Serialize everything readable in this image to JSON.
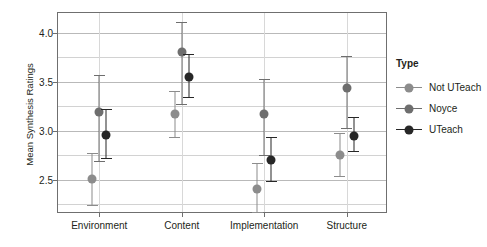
{
  "chart_data": {
    "type": "scatter",
    "title": "",
    "xlabel": "",
    "ylabel": "Mean Synthesis Ratings",
    "categories": [
      "Environment",
      "Content",
      "Implementation",
      "Structure"
    ],
    "ylim": [
      2.15,
      4.2
    ],
    "yticks": [
      2.5,
      3.0,
      3.5,
      4.0
    ],
    "ytick_labels": [
      "2.5",
      "3.0",
      "3.5",
      "4.0"
    ],
    "grid": true,
    "legend_title": "Type",
    "legend_position": "right",
    "series": [
      {
        "name": "Not UTeach",
        "color": "#8c8c8c",
        "values": [
          2.51,
          3.17,
          2.41,
          2.75
        ],
        "ci_low": [
          2.23,
          2.93,
          2.16,
          2.53
        ],
        "ci_high": [
          2.77,
          3.4,
          2.67,
          2.98
        ]
      },
      {
        "name": "Noyce",
        "color": "#6e6e6e",
        "values": [
          3.19,
          3.8,
          3.17,
          3.43
        ],
        "ci_low": [
          2.68,
          3.26,
          2.74,
          3.02
        ],
        "ci_high": [
          3.57,
          4.11,
          3.53,
          3.76
        ]
      },
      {
        "name": "UTeach",
        "color": "#272727",
        "values": [
          2.96,
          3.55,
          2.7,
          2.95
        ],
        "ci_low": [
          2.71,
          3.33,
          2.48,
          2.78
        ],
        "ci_high": [
          3.22,
          3.78,
          2.94,
          3.14
        ]
      }
    ]
  }
}
